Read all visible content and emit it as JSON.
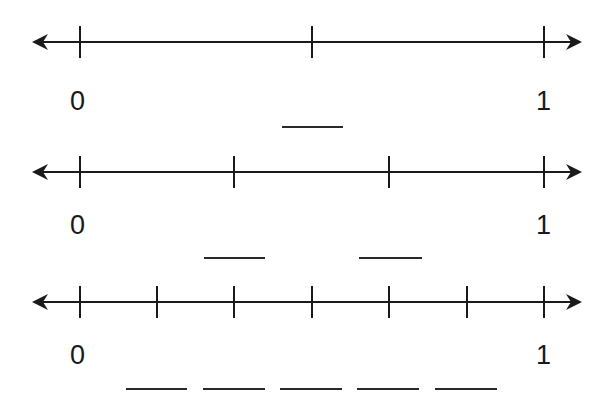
{
  "diagram": {
    "title": "",
    "number_lines": [
      {
        "name": "halves",
        "y": 42,
        "x_start": 32,
        "x_end": 582,
        "ticks_x": [
          80,
          312,
          544
        ],
        "start_label": "0",
        "end_label": "1",
        "label_y": 88,
        "blanks": [
          {
            "x": 282,
            "y": 126,
            "width": 61
          }
        ]
      },
      {
        "name": "thirds",
        "y": 172,
        "x_start": 32,
        "x_end": 582,
        "ticks_x": [
          80,
          234,
          389,
          544
        ],
        "start_label": "0",
        "end_label": "1",
        "label_y": 212,
        "blanks": [
          {
            "x": 204,
            "y": 257,
            "width": 61
          },
          {
            "x": 359,
            "y": 257,
            "width": 63
          }
        ]
      },
      {
        "name": "sixths",
        "y": 302,
        "x_start": 32,
        "x_end": 582,
        "ticks_x": [
          80,
          157,
          234,
          312,
          389,
          467,
          544
        ],
        "start_label": "0",
        "end_label": "1",
        "label_y": 342,
        "blanks": [
          {
            "x": 126,
            "y": 388,
            "width": 61
          },
          {
            "x": 203,
            "y": 388,
            "width": 62
          },
          {
            "x": 280,
            "y": 388,
            "width": 62
          },
          {
            "x": 357,
            "y": 388,
            "width": 62
          },
          {
            "x": 435,
            "y": 388,
            "width": 62
          }
        ]
      }
    ],
    "colors": {
      "line": "#1a1a1a",
      "background": "#ffffff"
    }
  }
}
